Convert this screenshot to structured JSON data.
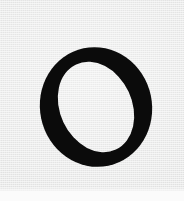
{
  "page": {
    "kind": "scanned-page-fragment",
    "width": 184,
    "height": 201,
    "background_color": "#ebeceb",
    "bottom_strip_color": "#fbfbfb",
    "bottom_strip_height": 10,
    "texture": "scan-grain"
  },
  "glyph": {
    "character": "O",
    "name": "latin-capital-letter-o",
    "style": "italic-serif",
    "color": "#0b0b0b",
    "bounds": {
      "x": 42,
      "y": 48,
      "width": 109,
      "height": 119
    },
    "stress": "oblique",
    "tilt_degrees": -12,
    "outer_ellipse": {
      "cx": 96,
      "cy": 107,
      "rx": 56,
      "ry": 60
    },
    "counter_ellipse": {
      "cx": 96,
      "cy": 107,
      "rx": 36,
      "ry": 47
    },
    "thick_stroke_width": 21,
    "thin_stroke_width": 6
  }
}
